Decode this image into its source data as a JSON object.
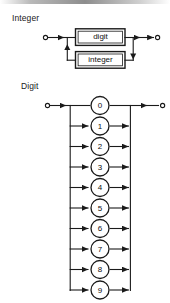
{
  "figure": {
    "type": "railroad-syntax-diagram",
    "ink_color": "#1a1a1a",
    "background_color": "#ffffff"
  },
  "diagrams": [
    {
      "name": "integer-diagram",
      "title": "Integer",
      "boxes": [
        {
          "label": "digit"
        },
        {
          "label": "integer"
        }
      ],
      "terminals": {
        "start": "o",
        "end": "o"
      }
    },
    {
      "name": "digit-diagram",
      "title": "Digit",
      "alternatives": [
        "0",
        "1",
        "2",
        "3",
        "4",
        "5",
        "6",
        "7",
        "8",
        "9"
      ],
      "terminals": {
        "start": "o",
        "end": "o"
      }
    }
  ]
}
